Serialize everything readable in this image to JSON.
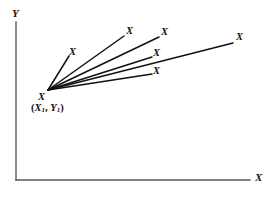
{
  "figure": {
    "type": "scatter",
    "background_color": "#ffffff",
    "ink_color": "#111111",
    "axis_color": "#5a5a5a",
    "axes": {
      "y_label": "Y",
      "x_label": "X",
      "origin_px": [
        16,
        180
      ],
      "y_top_px": [
        16,
        22
      ],
      "x_right_px": [
        250,
        180
      ],
      "y_label_pos_px": [
        12,
        8
      ],
      "x_label_pos_px": [
        255,
        172
      ]
    },
    "base_point": {
      "marker": "X",
      "coord_text_parts": {
        "open": "(",
        "x_var": "X",
        "x_sub": "1",
        "comma": ", ",
        "y_var": "Y",
        "y_sub": "1",
        "close": ")"
      },
      "coord_text": "(X1, Y1)",
      "marker_pos_px": [
        38,
        92
      ],
      "coord_pos_px": [
        31,
        103
      ],
      "vertex_px": [
        48,
        90
      ]
    },
    "rays": [
      {
        "name": "ray-1-short-upper-left",
        "end_px": [
          69,
          56
        ],
        "label": "X",
        "label_pos_px": [
          69,
          47
        ]
      },
      {
        "name": "ray-2-steep-upper",
        "end_px": [
          124,
          36
        ],
        "label": "X",
        "label_pos_px": [
          126,
          26
        ]
      },
      {
        "name": "ray-3-upper",
        "end_px": [
          159,
          37
        ],
        "label": "X",
        "label_pos_px": [
          161,
          27
        ]
      },
      {
        "name": "ray-4-middle",
        "end_px": [
          152,
          57
        ],
        "label": "X",
        "label_pos_px": [
          153,
          48
        ]
      },
      {
        "name": "ray-5-lower",
        "end_px": [
          152,
          74
        ],
        "label": "X",
        "label_pos_px": [
          153,
          66
        ]
      },
      {
        "name": "ray-6-long-right",
        "end_px": [
          233,
          43
        ],
        "label": "X",
        "label_pos_px": [
          236,
          32
        ]
      }
    ]
  },
  "chart_data": {
    "type": "scatter",
    "title": "",
    "xlabel": "X",
    "ylabel": "Y",
    "grid": false,
    "legend": null,
    "annotations": [
      "(X1, Y1)"
    ],
    "base_point_label": "X",
    "point_labels": [
      "X",
      "X",
      "X",
      "X",
      "X",
      "X"
    ],
    "series": [
      {
        "name": "rays-from-base-point",
        "origin": [
          48,
          90
        ],
        "endpoints": [
          [
            69,
            56
          ],
          [
            124,
            36
          ],
          [
            159,
            37
          ],
          [
            152,
            57
          ],
          [
            152,
            74
          ],
          [
            233,
            43
          ]
        ]
      }
    ]
  }
}
